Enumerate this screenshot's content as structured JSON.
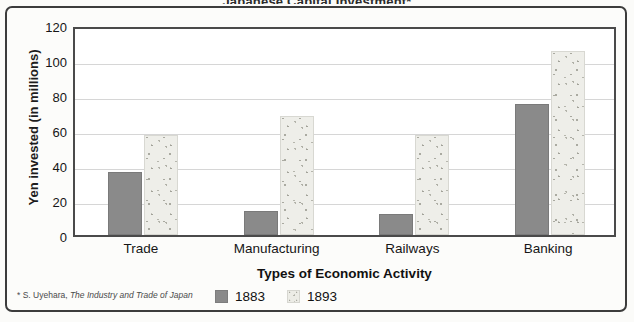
{
  "figure": {
    "cut_title": "Japanese Capital Investment*",
    "footnote_prefix": "* S. Uyehara, ",
    "footnote_italic": "The Industry and Trade of Japan"
  },
  "chart_data": {
    "type": "bar",
    "title": "Japanese Capital Investment*",
    "categories": [
      "Trade",
      "Manufacturing",
      "Railways",
      "Banking"
    ],
    "series": [
      {
        "name": "1883",
        "values": [
          36,
          14,
          12,
          75
        ],
        "color": "#8a8a8a"
      },
      {
        "name": "1893",
        "values": [
          57,
          68,
          57,
          105
        ],
        "color": "#ececE6"
      }
    ],
    "xlabel": "Types of Economic Activity",
    "ylabel": "Yen invested (in millions)",
    "ylim": [
      0,
      120
    ],
    "yticks": [
      0,
      20,
      40,
      60,
      80,
      100,
      120
    ],
    "grid": true,
    "legend_position": "bottom"
  }
}
